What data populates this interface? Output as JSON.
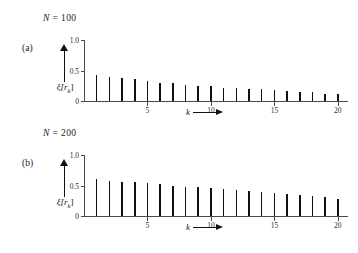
{
  "figure": {
    "panels": [
      {
        "tag": "(a)",
        "condition_label": "N = 100",
        "condition_symbol": "N",
        "condition_eq": " = ",
        "condition_value": "100",
        "ylabel": "ξ[r",
        "ylabel_sub": "k",
        "ylabel_close": "]",
        "xlabel": "k"
      },
      {
        "tag": "(b)",
        "condition_label": "N = 200",
        "condition_symbol": "N",
        "condition_eq": " = ",
        "condition_value": "200",
        "ylabel": "ξ[r",
        "ylabel_sub": "k",
        "ylabel_close": "]",
        "xlabel": "k"
      }
    ]
  },
  "chart_data": [
    {
      "type": "bar",
      "title": "N = 100",
      "panel": "(a)",
      "xlabel": "k",
      "ylabel": "ξ[r_k]",
      "xlim": [
        0,
        20.8
      ],
      "ylim": [
        0,
        1.0
      ],
      "yticks": [
        0,
        0.5,
        1.0
      ],
      "ytick_labels": [
        "0",
        "0.5",
        "1.0"
      ],
      "xticks": [
        5,
        10,
        15,
        20
      ],
      "xtick_labels": [
        "5",
        "10",
        "15",
        "20"
      ],
      "grid": false,
      "legend": false,
      "categories": [
        1,
        2,
        3,
        4,
        5,
        6,
        7,
        8,
        9,
        10,
        11,
        12,
        13,
        14,
        15,
        16,
        17,
        18,
        19,
        20
      ],
      "values": [
        0.43,
        0.4,
        0.38,
        0.36,
        0.33,
        0.3,
        0.29,
        0.27,
        0.25,
        0.24,
        0.22,
        0.21,
        0.2,
        0.19,
        0.18,
        0.16,
        0.15,
        0.14,
        0.12,
        0.11
      ]
    },
    {
      "type": "bar",
      "title": "N = 200",
      "panel": "(b)",
      "xlabel": "k",
      "ylabel": "ξ[r_k]",
      "xlim": [
        0,
        20.8
      ],
      "ylim": [
        0,
        1.0
      ],
      "yticks": [
        0,
        0.5,
        1.0
      ],
      "ytick_labels": [
        "0",
        "0.5",
        "1.0"
      ],
      "xticks": [
        5,
        10,
        15,
        20
      ],
      "xtick_labels": [
        "5",
        "10",
        "15",
        "20"
      ],
      "grid": false,
      "legend": false,
      "categories": [
        1,
        2,
        3,
        4,
        5,
        6,
        7,
        8,
        9,
        10,
        11,
        12,
        13,
        14,
        15,
        16,
        17,
        18,
        19,
        20
      ],
      "values": [
        0.6,
        0.58,
        0.56,
        0.55,
        0.54,
        0.52,
        0.5,
        0.48,
        0.47,
        0.46,
        0.45,
        0.42,
        0.41,
        0.39,
        0.38,
        0.36,
        0.34,
        0.33,
        0.31,
        0.28
      ]
    }
  ]
}
